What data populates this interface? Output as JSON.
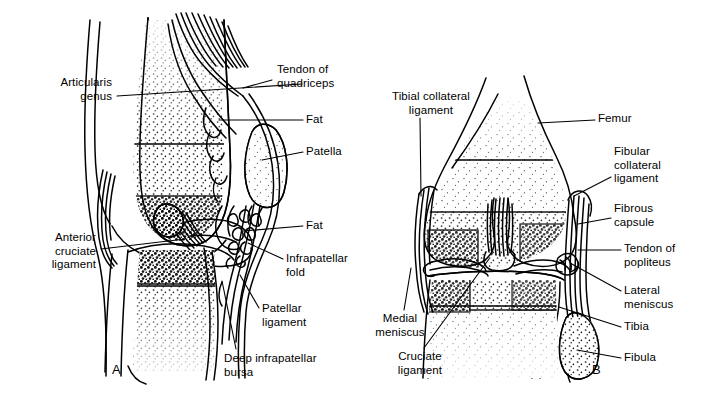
{
  "figure": {
    "type": "anatomical-illustration",
    "background_color": "#ffffff",
    "ink_color": "#000000"
  },
  "panels": [
    {
      "id": "A",
      "letter": "A",
      "letter_x": 112,
      "letter_y": 362,
      "view": "sagittal section of the knee"
    },
    {
      "id": "B",
      "letter": "B",
      "letter_x": 592,
      "letter_y": 362,
      "view": "anterior view of the knee"
    }
  ],
  "labels": [
    {
      "id": "articularis-genus",
      "panel": "A",
      "text": "Articularis\ngenus",
      "align": "right",
      "x": 20,
      "y": 76,
      "width": 92,
      "leader": [
        [
          117,
          96
        ],
        [
          302,
          84
        ]
      ]
    },
    {
      "id": "tendon-of-quadriceps",
      "panel": "A",
      "text": "Tendon of\nquadriceps",
      "align": "left",
      "x": 277,
      "y": 63,
      "width": 96,
      "leader": [
        [
          272,
          80
        ],
        [
          243,
          88
        ]
      ]
    },
    {
      "id": "fat-upper",
      "panel": "A",
      "text": "Fat",
      "align": "left",
      "x": 306,
      "y": 113,
      "width": 40,
      "leader": [
        [
          303,
          120
        ],
        [
          219,
          120
        ]
      ]
    },
    {
      "id": "patella",
      "panel": "A",
      "text": "Patella",
      "align": "left",
      "x": 306,
      "y": 145,
      "width": 60,
      "leader": [
        [
          303,
          152
        ],
        [
          262,
          160
        ]
      ]
    },
    {
      "id": "anterior-cruciate-ligament",
      "panel": "A",
      "text": "Anterior\ncruciate\nligament",
      "align": "right",
      "x": 16,
      "y": 231,
      "width": 80,
      "leader": [
        [
          101,
          249
        ],
        [
          185,
          239
        ]
      ]
    },
    {
      "id": "fat-lower",
      "panel": "A",
      "text": "Fat",
      "align": "left",
      "x": 306,
      "y": 219,
      "width": 40,
      "leader": [
        [
          303,
          226
        ],
        [
          243,
          231
        ]
      ]
    },
    {
      "id": "infrapatellar-fold",
      "panel": "A",
      "text": "Infrapatellar\nfold",
      "align": "left",
      "x": 286,
      "y": 252,
      "width": 94,
      "leader": [
        [
          283,
          259
        ],
        [
          248,
          243
        ]
      ]
    },
    {
      "id": "patellar-ligament",
      "panel": "A",
      "text": "Patellar\nligament",
      "align": "left",
      "x": 262,
      "y": 302,
      "width": 76,
      "leader": [
        [
          259,
          308
        ],
        [
          240,
          275
        ]
      ]
    },
    {
      "id": "deep-infrapatellar-bursa",
      "panel": "A",
      "text": "Deep infrapatellar\nbursa",
      "align": "left",
      "x": 224,
      "y": 352,
      "width": 136,
      "leader": [
        [
          236,
          349
        ],
        [
          222,
          281
        ]
      ]
    },
    {
      "id": "tibial-collateral-ligament",
      "panel": "B",
      "text": "Tibial collateral\nligament",
      "align": "center",
      "x": 372,
      "y": 90,
      "width": 118,
      "leader": [
        [
          420,
          118
        ],
        [
          421,
          196
        ]
      ]
    },
    {
      "id": "femur",
      "panel": "B",
      "text": "Femur",
      "align": "left",
      "x": 598,
      "y": 112,
      "width": 60,
      "leader": [
        [
          595,
          120
        ],
        [
          538,
          123
        ]
      ]
    },
    {
      "id": "fibular-collateral-ligament",
      "panel": "B",
      "text": "Fibular\ncollateral\nligament",
      "align": "left",
      "x": 614,
      "y": 145,
      "width": 80,
      "leader": [
        [
          611,
          177
        ],
        [
          574,
          196
        ]
      ]
    },
    {
      "id": "fibrous-capsule",
      "panel": "B",
      "text": "Fibrous\ncapsule",
      "align": "left",
      "x": 614,
      "y": 202,
      "width": 80,
      "leader": [
        [
          611,
          218
        ],
        [
          578,
          224
        ]
      ]
    },
    {
      "id": "tendon-of-popliteus",
      "panel": "B",
      "text": "Tendon of\npopliteus",
      "align": "left",
      "x": 624,
      "y": 242,
      "width": 80,
      "leader": [
        [
          621,
          250
        ],
        [
          578,
          250
        ]
      ]
    },
    {
      "id": "lateral-meniscus",
      "panel": "B",
      "text": "Lateral\nmeniscus",
      "align": "left",
      "x": 624,
      "y": 284,
      "width": 80,
      "leader": [
        [
          621,
          291
        ],
        [
          570,
          263
        ]
      ]
    },
    {
      "id": "tibia",
      "panel": "B",
      "text": "Tibia",
      "align": "left",
      "x": 624,
      "y": 320,
      "width": 60,
      "leader": [
        [
          621,
          327
        ],
        [
          559,
          307
        ]
      ]
    },
    {
      "id": "fibula",
      "panel": "B",
      "text": "Fibula",
      "align": "left",
      "x": 624,
      "y": 351,
      "width": 60,
      "leader": [
        [
          621,
          358
        ],
        [
          577,
          350
        ]
      ]
    },
    {
      "id": "medial-meniscus",
      "panel": "B",
      "text": "Medial\nmeniscus",
      "align": "center",
      "x": 362,
      "y": 312,
      "width": 76,
      "leader": [
        [
          404,
          310
        ],
        [
          411,
          268
        ]
      ]
    },
    {
      "id": "cruciate-ligament",
      "panel": "B",
      "text": "Cruciate\nligament",
      "align": "center",
      "x": 382,
      "y": 350,
      "width": 76,
      "leader": [
        [
          424,
          348
        ],
        [
          489,
          259
        ]
      ]
    }
  ]
}
